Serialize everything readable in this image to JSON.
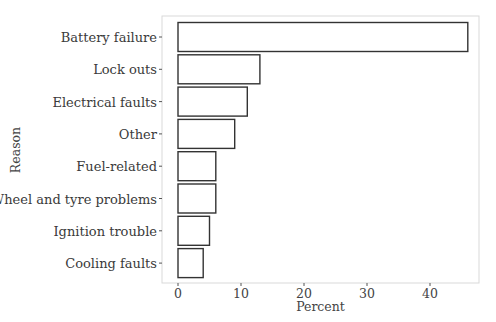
{
  "chart_data": {
    "type": "bar",
    "orientation": "horizontal",
    "title": "",
    "xlabel": "Percent",
    "ylabel": "Reason",
    "categories": [
      "Battery failure",
      "Lock outs",
      "Electrical faults",
      "Other",
      "Fuel-related",
      "Wheel and tyre problems",
      "Ignition trouble",
      "Cooling faults"
    ],
    "values": [
      46,
      13,
      11,
      9,
      6,
      6,
      5,
      4
    ],
    "xlim": [
      -2.5,
      47.5
    ],
    "xticks": [
      0,
      10,
      20,
      30,
      40
    ],
    "xtick_labels": [
      "0",
      "10",
      "20",
      "30",
      "40"
    ],
    "grid": false,
    "legend": null,
    "bar_fill": "#ffffff",
    "bar_edge": "#333333"
  }
}
